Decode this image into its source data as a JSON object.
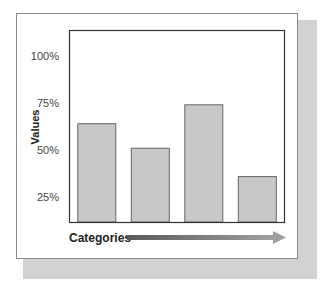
{
  "chart_data": {
    "type": "bar",
    "title": "",
    "xlabel": "Categories",
    "ylabel": "Values",
    "categories": [
      "",
      "",
      "",
      ""
    ],
    "values": [
      64,
      51,
      74,
      36
    ],
    "value_unit": "%",
    "yticks": [
      25,
      50,
      75,
      100
    ],
    "ytick_labels": [
      "25%",
      "50%",
      "75%",
      "100%"
    ],
    "ylim": [
      12,
      113
    ],
    "grid": false,
    "legend": "none",
    "colors": {
      "bar_fill": "#c8c8c8",
      "bar_stroke": "#666666",
      "axis_box": "#333333",
      "arrow_start": "#5a5a5a",
      "arrow_end": "#a0a0a0"
    }
  }
}
